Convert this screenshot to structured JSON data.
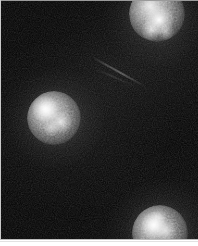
{
  "image": {
    "kind": "fluorescence-micrograph",
    "background_color": "#000000",
    "frame": {
      "x": 0,
      "y": 0,
      "width": 198,
      "height": 240
    },
    "canvas": {
      "width": 198,
      "height": 246
    },
    "footer_strip_color": "#ffffff",
    "edge_rule_color": "#c9c9c9",
    "glow_color": "#ffffff",
    "grain_opacity": 0.38
  },
  "objects": [
    {
      "name": "sphere-left",
      "label": "left luminous sphere",
      "cx": 54,
      "cy": 118,
      "radius": 27,
      "peak_brightness": 0.95,
      "hotspots": [
        {
          "x": -9,
          "y": -9,
          "r": 13,
          "intensity": 0.95
        },
        {
          "x": 7,
          "y": 4,
          "r": 11,
          "intensity": 0.72
        },
        {
          "x": -3,
          "y": 10,
          "r": 8,
          "intensity": 0.5
        }
      ],
      "halo_radius": 56,
      "clipped_edge": "none"
    },
    {
      "name": "sphere-top-right",
      "label": "top-right luminous sphere",
      "cx": 157,
      "cy": 14,
      "radius": 28,
      "peak_brightness": 0.98,
      "hotspots": [
        {
          "x": 2,
          "y": 6,
          "r": 14,
          "intensity": 0.98
        },
        {
          "x": -6,
          "y": 16,
          "r": 10,
          "intensity": 0.66
        },
        {
          "x": 9,
          "y": 18,
          "r": 8,
          "intensity": 0.48
        }
      ],
      "halo_radius": 58,
      "clipped_edge": "top"
    },
    {
      "name": "sphere-bottom-right",
      "label": "bottom-right luminous sphere",
      "cx": 160,
      "cy": 233,
      "radius": 28,
      "peak_brightness": 0.92,
      "hotspots": [
        {
          "x": -6,
          "y": -8,
          "r": 13,
          "intensity": 0.92
        },
        {
          "x": 6,
          "y": -2,
          "r": 10,
          "intensity": 0.62
        },
        {
          "x": -2,
          "y": -16,
          "r": 8,
          "intensity": 0.44
        }
      ],
      "halo_radius": 58,
      "clipped_edge": "bottom"
    }
  ],
  "streak": {
    "name": "diagonal-filament",
    "label": "faint diagonal filament",
    "x": 92,
    "y": 56,
    "length": 62,
    "angle_deg": 29,
    "intensity": 0.42
  }
}
